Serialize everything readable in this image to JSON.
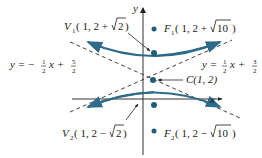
{
  "diagram": {
    "type": "hyperbola",
    "axes": {
      "x_label": "x",
      "y_label": "y"
    },
    "center": {
      "label": "C(1, 2)",
      "name": "C",
      "coords": "(1, 2)"
    },
    "vertices": [
      {
        "name": "V",
        "sub": "1",
        "coords_prefix": "( 1, 2 +",
        "radicand": "2",
        "coords_suffix": ")"
      },
      {
        "name": "V",
        "sub": "2",
        "coords_prefix": "( 1, 2 −",
        "radicand": "2",
        "coords_suffix": ")"
      }
    ],
    "foci": [
      {
        "name": "F",
        "sub": "1",
        "coords_prefix": "( 1, 2 +",
        "radicand": "10",
        "coords_suffix": ")"
      },
      {
        "name": "F",
        "sub": "2",
        "coords_prefix": "( 1, 2 −",
        "radicand": "10",
        "coords_suffix": ")"
      }
    ],
    "asymptotes": [
      {
        "lhs": "y = −",
        "frac1_num": "1",
        "frac1_den": "2",
        "mid": "x +",
        "frac2_num": "5",
        "frac2_den": "2"
      },
      {
        "lhs": "y =",
        "frac1_num": "1",
        "frac1_den": "2",
        "mid": "x +",
        "frac2_num": "3",
        "frac2_den": "2"
      }
    ],
    "colors": {
      "curve": "#2e6b8a",
      "axis": "#333333",
      "asymptote": "#444444",
      "point": "#1f5e7a"
    }
  }
}
